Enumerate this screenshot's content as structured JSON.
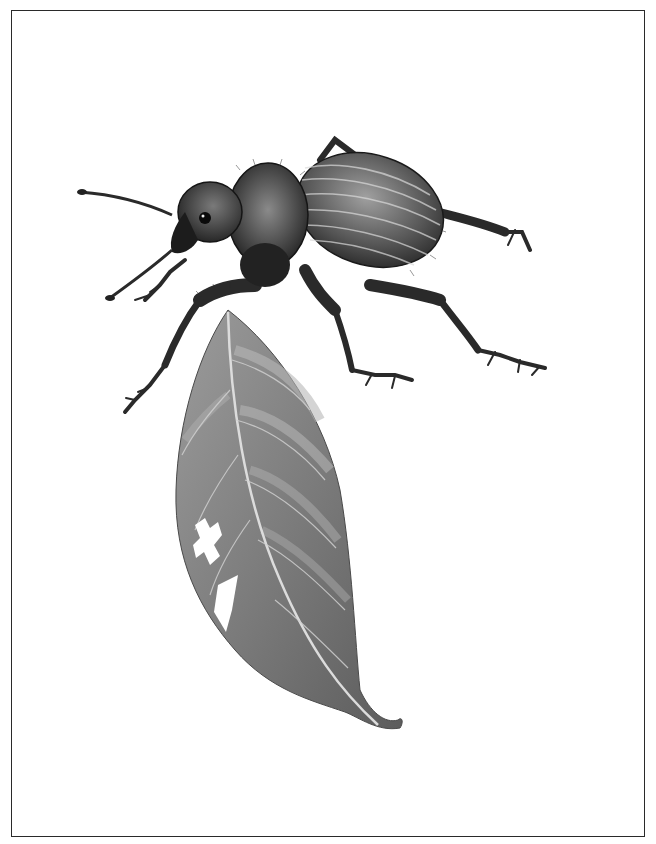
{
  "illustration": {
    "subject": "weevil beetle standing on a leaf",
    "style": "grayscale pencil illustration",
    "frame": {
      "color": "#2a2a2a",
      "background": "#ffffff"
    },
    "colors": {
      "beetle_dark": "#1e1e1e",
      "beetle_mid": "#555555",
      "beetle_light": "#9a9a9a",
      "leaf_dark": "#5a5a5a",
      "leaf_mid": "#8a8a8a",
      "leaf_light": "#b5b5b5",
      "vein": "#d6d6d6"
    }
  }
}
